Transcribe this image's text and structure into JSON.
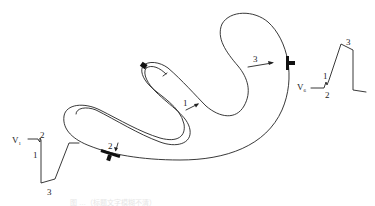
{
  "diagram": {
    "type": "cardiac-activation-schematic",
    "vectors": [
      {
        "id": "1",
        "label": "1"
      },
      {
        "id": "2",
        "label": "2"
      },
      {
        "id": "3",
        "label": "3"
      }
    ],
    "leads": {
      "left": {
        "name": "V",
        "subscript": "1",
        "labels": {
          "a": "2",
          "b": "1",
          "c": "3"
        }
      },
      "right": {
        "name": "V",
        "subscript": "6",
        "labels": {
          "a": "1",
          "b": "2",
          "c": "3"
        }
      }
    },
    "electrodes": [
      {
        "name": "electrode-v1"
      },
      {
        "name": "electrode-v6"
      }
    ],
    "caption": "图 …（标题文字模糊不清）"
  }
}
